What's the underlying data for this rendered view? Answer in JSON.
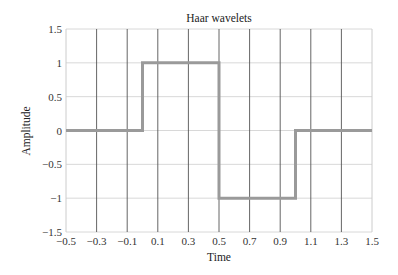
{
  "chart_data": {
    "type": "line",
    "title": "Haar wavelets",
    "xlabel": "Time",
    "ylabel": "Amplitude",
    "xlim": [
      -0.5,
      1.5
    ],
    "ylim": [
      -1.5,
      1.5
    ],
    "xticks": [
      -0.5,
      -0.3,
      -0.1,
      0.1,
      0.3,
      0.5,
      0.7,
      0.9,
      1.1,
      1.3,
      1.5
    ],
    "xtick_labels": [
      "−0.5",
      "−0.3",
      "−0.1",
      "0.1",
      "0.3",
      "0.5",
      "0.7",
      "0.9",
      "1.1",
      "1.3",
      "1.5"
    ],
    "yticks": [
      -1.5,
      -1,
      -0.5,
      0,
      0.5,
      1,
      1.5
    ],
    "ytick_labels": [
      "−1.5",
      "−1",
      "−0.5",
      "0",
      "0.5",
      "1",
      "1.5"
    ],
    "grid": true,
    "legend": null,
    "series": [
      {
        "name": "Haar wavelet",
        "color": "#9a9a9a",
        "x": [
          -0.5,
          0,
          0,
          0.5,
          0.5,
          1,
          1,
          1.5
        ],
        "y": [
          0,
          0,
          1,
          1,
          -1,
          -1,
          0,
          0
        ]
      }
    ]
  },
  "colors": {
    "line": "#9a9a9a",
    "vgrid": "#555555",
    "hgrid": "#d8d8d8",
    "axis": "#cccccc"
  }
}
